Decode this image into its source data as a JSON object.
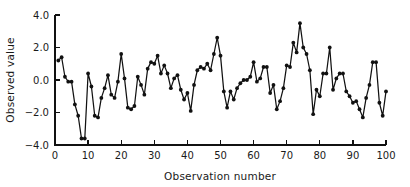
{
  "chart_data": {
    "type": "line",
    "title": "",
    "xlabel": "Observation number",
    "ylabel": "Observed value",
    "xlim": [
      0,
      100
    ],
    "ylim": [
      -4.0,
      4.0
    ],
    "grid": false,
    "legend": null,
    "marker": "filled-circle",
    "xticks": [
      0,
      10,
      20,
      30,
      40,
      50,
      60,
      70,
      80,
      90,
      100
    ],
    "xtick_labels": [
      "0",
      "10",
      "20",
      "30",
      "40",
      "50",
      "60",
      "70",
      "80",
      "90",
      "100"
    ],
    "yticks": [
      -4.0,
      -2.0,
      0.0,
      2.0,
      4.0
    ],
    "ytick_labels": [
      "-4.0",
      "-2.0",
      "0.0",
      "2.0",
      "4.0"
    ],
    "x": [
      1,
      2,
      3,
      4,
      5,
      6,
      7,
      8,
      9,
      10,
      11,
      12,
      13,
      14,
      15,
      16,
      17,
      18,
      19,
      20,
      21,
      22,
      23,
      24,
      25,
      26,
      27,
      28,
      29,
      30,
      31,
      32,
      33,
      34,
      35,
      36,
      37,
      38,
      39,
      40,
      41,
      42,
      43,
      44,
      45,
      46,
      47,
      48,
      49,
      50,
      51,
      52,
      53,
      54,
      55,
      56,
      57,
      58,
      59,
      60,
      61,
      62,
      63,
      64,
      65,
      66,
      67,
      68,
      69,
      70,
      71,
      72,
      73,
      74,
      75,
      76,
      77,
      78,
      79,
      80,
      81,
      82,
      83,
      84,
      85,
      86,
      87,
      88,
      89,
      90,
      91,
      92,
      93,
      94,
      95,
      96,
      97,
      98,
      99,
      100
    ],
    "values": [
      1.2,
      1.4,
      0.2,
      -0.1,
      -0.1,
      -1.5,
      -2.2,
      -3.6,
      -3.6,
      0.4,
      -0.4,
      -2.2,
      -2.3,
      -1.1,
      -0.5,
      0.3,
      -0.9,
      -1.1,
      -0.1,
      1.6,
      0.1,
      -1.7,
      -1.8,
      -1.6,
      0.2,
      -0.3,
      -0.9,
      0.7,
      1.1,
      1.0,
      1.5,
      0.4,
      0.9,
      0.4,
      -0.5,
      0.1,
      0.3,
      -0.6,
      -1.2,
      -0.8,
      -1.9,
      -0.3,
      0.6,
      0.8,
      0.7,
      1.0,
      0.6,
      1.6,
      2.6,
      1.5,
      -0.7,
      -1.7,
      -0.7,
      -1.2,
      -0.5,
      -0.2,
      0.0,
      0.0,
      0.2,
      1.1,
      -0.1,
      0.1,
      0.8,
      0.8,
      -0.8,
      -0.3,
      -1.8,
      -1.3,
      -0.5,
      0.9,
      0.8,
      2.3,
      1.7,
      3.5,
      2.0,
      1.6,
      0.6,
      -2.1,
      -0.6,
      -1.0,
      0.4,
      0.4,
      2.0,
      -0.6,
      0.1,
      0.4,
      0.4,
      -0.7,
      -1.0,
      -1.4,
      -1.3,
      -1.8,
      -2.3,
      -1.1,
      -0.3,
      1.1,
      1.1,
      -1.4,
      -2.2,
      -0.7
    ]
  },
  "axes": {
    "x_title": "Observation number",
    "y_title": "Observed value"
  }
}
